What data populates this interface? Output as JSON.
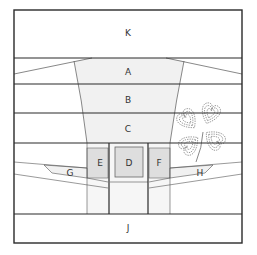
{
  "diagram": {
    "type": "quilt-block-assembly",
    "colors": {
      "line": "#2a2a2a",
      "thin_line": "#555555",
      "light_fill": "#f1f1f1",
      "mid_fill": "#dedede",
      "background": "#ffffff",
      "motif_stroke": "#666666"
    },
    "labels": {
      "K": "K",
      "A": "A",
      "B": "B",
      "C": "C",
      "D": "D",
      "E": "E",
      "F": "F",
      "G": "G",
      "H": "H",
      "J": "J"
    },
    "motif": "four-leaf-clover-heart-quilting"
  }
}
